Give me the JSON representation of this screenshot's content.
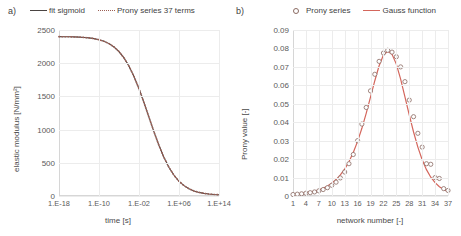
{
  "figure": {
    "panels": [
      {
        "tag": "a)",
        "legend": [
          {
            "label": "fit sigmoid",
            "style": "solid-line",
            "color": "#4a4442"
          },
          {
            "label": "Prony series 37 terms",
            "style": "dotted-line",
            "color": "#9b5f55"
          }
        ]
      },
      {
        "tag": "b)",
        "legend": [
          {
            "label": "Prony series",
            "style": "open-circle",
            "color": "#8a6a62"
          },
          {
            "label": "Gauss function",
            "style": "solid-line",
            "color": "#d4665c"
          }
        ]
      }
    ]
  },
  "chart_data": [
    {
      "type": "line",
      "title": "",
      "panel": "a)",
      "xlabel": "time [s]",
      "ylabel": "elastic modulus [N/mm²]",
      "xscale": "log",
      "xlim": [
        1e-18,
        100000000000000.0
      ],
      "ylim": [
        0,
        2500
      ],
      "yticks": [
        0,
        500,
        1000,
        1500,
        2000,
        2500
      ],
      "xticks": [
        1e-18,
        1e-10,
        0.01,
        1000000.0,
        100000000000000.0
      ],
      "xticklabels": [
        "1.E-18",
        "1.E-10",
        "1.E-02",
        "1.E+06",
        "1.E+14"
      ],
      "grid": true,
      "legend_position": "above",
      "series": [
        {
          "name": "fit sigmoid",
          "style": "solid",
          "color": "#4a4442",
          "x_log10": [
            -18,
            -17,
            -16,
            -15,
            -14,
            -13,
            -12,
            -11,
            -10,
            -9,
            -8,
            -7,
            -6,
            -5,
            -4,
            -3,
            -2,
            -1,
            0,
            1,
            2,
            3,
            4,
            5,
            6,
            7,
            8,
            9,
            10,
            11,
            12,
            13,
            14
          ],
          "values": [
            2400,
            2399,
            2398,
            2396,
            2393,
            2388,
            2381,
            2370,
            2354,
            2330,
            2295,
            2245,
            2175,
            2080,
            1955,
            1800,
            1615,
            1405,
            1185,
            965,
            760,
            580,
            430,
            312,
            222,
            156,
            109,
            76,
            54,
            39,
            29,
            23,
            19
          ]
        },
        {
          "name": "Prony series 37 terms",
          "style": "dotted",
          "color": "#9b5f55",
          "x_log10": [
            -18,
            -17,
            -16,
            -15,
            -14,
            -13,
            -12,
            -11,
            -10,
            -9,
            -8,
            -7,
            -6,
            -5,
            -4,
            -3,
            -2,
            -1,
            0,
            1,
            2,
            3,
            4,
            5,
            6,
            7,
            8,
            9,
            10,
            11,
            12,
            13,
            14
          ],
          "values": [
            2400,
            2399,
            2398,
            2396,
            2393,
            2388,
            2381,
            2370,
            2354,
            2330,
            2295,
            2245,
            2175,
            2080,
            1955,
            1800,
            1615,
            1405,
            1185,
            965,
            760,
            580,
            430,
            312,
            222,
            156,
            109,
            76,
            54,
            39,
            29,
            23,
            19
          ]
        }
      ]
    },
    {
      "type": "scatter",
      "title": "",
      "panel": "b)",
      "xlabel": "network number [-]",
      "ylabel": "Prony value [-]",
      "xlim": [
        1,
        37
      ],
      "ylim": [
        0,
        0.09
      ],
      "yticks": [
        0,
        0.01,
        0.02,
        0.03,
        0.04,
        0.05,
        0.06,
        0.07,
        0.08,
        0.09
      ],
      "yticklabels": [
        "0",
        "0.01",
        "0.02",
        "0.03",
        "0.04",
        "0.05",
        "0.06",
        "0.07",
        "0.08",
        "0.09"
      ],
      "xticks": [
        1,
        4,
        7,
        10,
        13,
        16,
        19,
        22,
        25,
        28,
        31,
        34,
        37
      ],
      "grid": true,
      "legend_position": "above",
      "series": [
        {
          "name": "Prony series",
          "style": "open-circle",
          "color": "#8a6a62",
          "x": [
            1,
            2,
            3,
            4,
            5,
            6,
            7,
            8,
            9,
            10,
            11,
            12,
            13,
            14,
            15,
            16,
            17,
            18,
            19,
            20,
            21,
            22,
            23,
            24,
            25,
            26,
            27,
            28,
            29,
            30,
            31,
            32,
            33,
            34,
            35,
            36,
            37
          ],
          "values": [
            0.0008,
            0.001,
            0.0012,
            0.0015,
            0.0018,
            0.0022,
            0.0028,
            0.0035,
            0.0045,
            0.0058,
            0.0075,
            0.0098,
            0.013,
            0.0175,
            0.0225,
            0.03,
            0.039,
            0.048,
            0.057,
            0.066,
            0.073,
            0.0775,
            0.079,
            0.078,
            0.0755,
            0.07,
            0.062,
            0.052,
            0.043,
            0.034,
            0.0265,
            0.0175,
            0.0172,
            0.01,
            0.0095,
            0.004,
            0.003
          ]
        },
        {
          "name": "Gauss function",
          "style": "solid",
          "color": "#d4665c",
          "x": [
            1,
            2,
            3,
            4,
            5,
            6,
            7,
            8,
            9,
            10,
            11,
            12,
            13,
            14,
            15,
            16,
            17,
            18,
            19,
            20,
            21,
            22,
            23,
            24,
            25,
            26,
            27,
            28,
            29,
            30,
            31,
            32,
            33,
            34,
            35,
            36,
            37
          ],
          "values": [
            0.0006,
            0.0009,
            0.0013,
            0.0017,
            0.0021,
            0.0026,
            0.0033,
            0.0042,
            0.0054,
            0.0069,
            0.0089,
            0.0114,
            0.0146,
            0.0186,
            0.0236,
            0.0296,
            0.0367,
            0.0448,
            0.0536,
            0.0625,
            0.0706,
            0.0764,
            0.0785,
            0.0768,
            0.0715,
            0.0634,
            0.0538,
            0.044,
            0.0347,
            0.0265,
            0.0197,
            0.0143,
            0.0102,
            0.0072,
            0.005,
            0.0035,
            0.0024
          ]
        }
      ]
    }
  ]
}
